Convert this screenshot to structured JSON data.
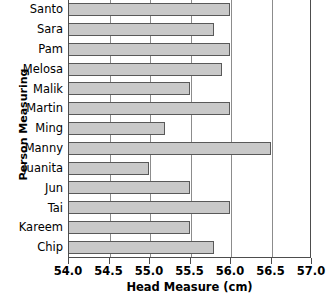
{
  "chart_data": {
    "type": "bar",
    "orientation": "horizontal",
    "title": "",
    "xlabel": "Head Measure (cm)",
    "ylabel": "Person Measuring",
    "categories": [
      "Santo",
      "Sara",
      "Pam",
      "Melosa",
      "Malik",
      "Martin",
      "Ming",
      "Manny",
      "Juanita",
      "Jun",
      "Tai",
      "Kareem",
      "Chip"
    ],
    "values": [
      56.0,
      55.8,
      56.0,
      55.9,
      55.5,
      56.0,
      55.2,
      56.5,
      55.0,
      55.5,
      56.0,
      55.5,
      55.8
    ],
    "xlim": [
      54.0,
      57.0
    ],
    "xticks": [
      54.0,
      54.5,
      55.0,
      55.5,
      56.0,
      56.5,
      57.0
    ],
    "xticklabels": [
      "54.0",
      "54.5",
      "55.0",
      "55.5",
      "56.0",
      "56.5",
      "57.0"
    ],
    "grid": "vertical",
    "legend": null,
    "bar_fill_color": "#c9c9c9",
    "bar_edge_color": "#595959",
    "axis_color": "#4d4d4d",
    "gridline_color": "#8c8c8c",
    "background_color": "#ffffff"
  }
}
